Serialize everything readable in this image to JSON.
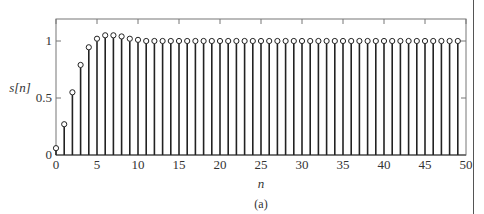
{
  "figure": {
    "caption": "(a)"
  },
  "chart_data": {
    "type": "stem",
    "title": "",
    "xlabel": "n",
    "ylabel": "s[n]",
    "xlim": [
      0,
      50
    ],
    "ylim": [
      0,
      1.2
    ],
    "xticks": [
      0,
      5,
      10,
      15,
      20,
      25,
      30,
      35,
      40,
      45,
      50
    ],
    "yticks": [
      0,
      0.5,
      1
    ],
    "ytick_labels": [
      "0",
      "0.5",
      "1"
    ],
    "grid": false,
    "x": [
      0,
      1,
      2,
      3,
      4,
      5,
      6,
      7,
      8,
      9,
      10,
      11,
      12,
      13,
      14,
      15,
      16,
      17,
      18,
      19,
      20,
      21,
      22,
      23,
      24,
      25,
      26,
      27,
      28,
      29,
      30,
      31,
      32,
      33,
      34,
      35,
      36,
      37,
      38,
      39,
      40,
      41,
      42,
      43,
      44,
      45,
      46,
      47,
      48,
      49
    ],
    "values": [
      0.06,
      0.27,
      0.55,
      0.79,
      0.945,
      1.02,
      1.05,
      1.05,
      1.04,
      1.02,
      1.01,
      1.0,
      1.0,
      1.0,
      1.0,
      1.0,
      1.0,
      1.0,
      1.0,
      1.0,
      1.0,
      1.0,
      1.0,
      1.0,
      1.0,
      1.0,
      1.0,
      1.0,
      1.0,
      1.0,
      1.0,
      1.0,
      1.0,
      1.0,
      1.0,
      1.0,
      1.0,
      1.0,
      1.0,
      1.0,
      1.0,
      1.0,
      1.0,
      1.0,
      1.0,
      1.0,
      1.0,
      1.0,
      1.0,
      1.0
    ],
    "marker": "open-circle",
    "colors": {
      "stem": "#222222",
      "axis": "#777777",
      "marker_fill": "#ffffff"
    }
  },
  "layout": {
    "plot_left": 56,
    "plot_right": 466,
    "plot_top": 19,
    "plot_bottom": 155
  }
}
